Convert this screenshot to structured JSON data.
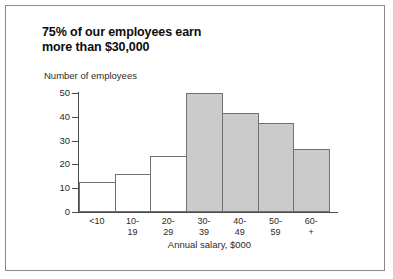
{
  "title": "75% of our employees earn\nmore than $30,000",
  "chart_data": {
    "type": "bar",
    "title": "75% of our employees earn more than $30,000",
    "xlabel": "Annual salary, $000",
    "ylabel": "Number of employees",
    "categories": [
      "<10",
      "10-\n19",
      "20-\n29",
      "30-\n39",
      "40-\n49",
      "50-\n59",
      "60-\n+"
    ],
    "values": [
      12.5,
      16,
      23.5,
      50,
      41.5,
      37.5,
      26.5
    ],
    "bar_styles": [
      "hollow",
      "hollow",
      "hollow",
      "filled",
      "filled",
      "filled",
      "filled"
    ],
    "ylim": [
      0,
      50
    ],
    "yticks": [
      0,
      10,
      20,
      30,
      40,
      50
    ],
    "ytick_labels": [
      "0",
      "10",
      "20",
      "30",
      "40",
      "50"
    ],
    "grid": false,
    "legend": "none",
    "colors": {
      "bar_fill": "#cbcbcb",
      "bar_hollow": "#ffffff",
      "bar_edge": "#707070",
      "axis": "#4a4a4a",
      "text": "#2b2b2b",
      "title": "#0d0d0d",
      "border": "#8a8a8a",
      "background": "#ffffff"
    }
  }
}
